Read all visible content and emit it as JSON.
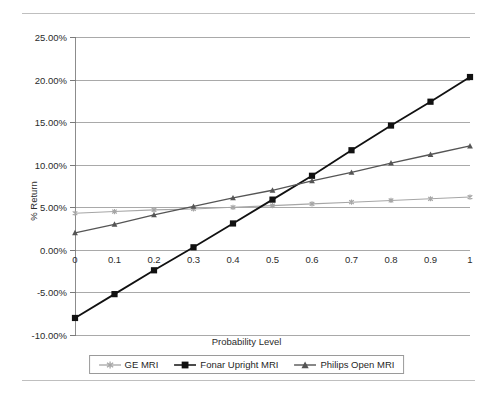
{
  "figure": {
    "cropped_caption": "",
    "axis_title_x": "Probability Level",
    "axis_title_y": "% Return"
  },
  "chart_data": {
    "type": "line",
    "title": "",
    "xlabel": "Probability Level",
    "ylabel": "% Return",
    "x": [
      0,
      0.1,
      0.2,
      0.3,
      0.4,
      0.5,
      0.6,
      0.7,
      0.8,
      0.9,
      1
    ],
    "xticklabels": [
      "0",
      "0.1",
      "0.2",
      "0.3",
      "0.4",
      "0.5",
      "0.6",
      "0.7",
      "0.8",
      "0.9",
      "1"
    ],
    "yticklabels": [
      "-10.00%",
      "-5.00%",
      "0.00%",
      "5.00%",
      "10.00%",
      "15.00%",
      "20.00%",
      "25.00%"
    ],
    "yticks": [
      -10,
      -5,
      0,
      5,
      10,
      15,
      20,
      25
    ],
    "xlim": [
      0,
      1
    ],
    "ylim": [
      -10,
      25
    ],
    "grid": "horizontal",
    "legend_position": "bottom",
    "series": [
      {
        "name": "GE MRI",
        "color": "#a6a6a6",
        "marker": "star",
        "values": [
          4.3,
          4.5,
          4.7,
          4.8,
          5.0,
          5.2,
          5.4,
          5.6,
          5.8,
          6.0,
          6.2
        ]
      },
      {
        "name": "Fonar Upright MRI",
        "color": "#111111",
        "marker": "square",
        "values": [
          -8.0,
          -5.2,
          -2.4,
          0.3,
          3.1,
          5.9,
          8.7,
          11.7,
          14.6,
          17.4,
          20.3
        ]
      },
      {
        "name": "Philips Open MRI",
        "color": "#555555",
        "marker": "triangle",
        "values": [
          2.0,
          3.0,
          4.1,
          5.1,
          6.1,
          7.0,
          8.1,
          9.1,
          10.2,
          11.2,
          12.2
        ]
      }
    ]
  },
  "legend": {
    "items": [
      {
        "label": "GE MRI"
      },
      {
        "label": "Fonar Upright MRI"
      },
      {
        "label": "Philips Open MRI"
      }
    ]
  }
}
